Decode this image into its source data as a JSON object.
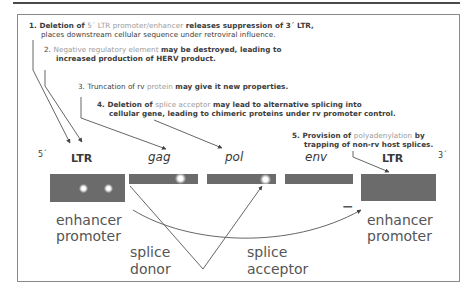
{
  "notes": [
    {
      "num": "1.",
      "parts": [
        {
          "t": "Deletion of ",
          "hl": false
        },
        {
          "t": "5´ LTR promoter/enhancer",
          "hl": true
        },
        {
          "t": " releases suppression of 3´ LTR,",
          "hl": false
        }
      ],
      "line2": "places downstream cellular sequence under retroviral influence."
    },
    {
      "num": "2.",
      "parts": [
        {
          "t": "Negative regulatory element",
          "hl": true
        },
        {
          "t": " may be destroyed, leading to",
          "hl": false
        }
      ],
      "line2": "increased production of HERV product."
    },
    {
      "num": "3.",
      "parts": [
        {
          "t": "Truncation of rv ",
          "hl": false
        },
        {
          "t": "protein",
          "hl": true
        },
        {
          "t": " may give it new properties.",
          "hl": false
        }
      ],
      "line2": ""
    },
    {
      "num": "4.",
      "parts": [
        {
          "t": "Deletion of ",
          "hl": false
        },
        {
          "t": "splice acceptor",
          "hl": true
        },
        {
          "t": " may lead to alternative splicing into",
          "hl": false
        }
      ],
      "line2": "cellular gene, leading to chimeric proteins under rv promoter control."
    },
    {
      "num": "5.",
      "parts": [
        {
          "t": "Provision of ",
          "hl": false
        },
        {
          "t": "polyadenylation",
          "hl": true
        },
        {
          "t": " by",
          "hl": false
        }
      ],
      "line2": "trapping of non-rv host splices."
    }
  ],
  "genome": {
    "end5": "5´",
    "end3": "3´",
    "segments": [
      {
        "label": "LTR",
        "italic": false
      },
      {
        "label": "gag",
        "italic": true
      },
      {
        "label": "pol",
        "italic": true
      },
      {
        "label": "env",
        "italic": true
      },
      {
        "label": "LTR",
        "italic": false
      }
    ]
  },
  "annotations": {
    "left_enhancer": "enhancer",
    "left_promoter": "promoter",
    "right_enhancer": "enhancer",
    "right_promoter": "promoter",
    "splice_donor_1": "splice",
    "splice_donor_2": "donor",
    "splice_acceptor_1": "splice",
    "splice_acceptor_2": "acceptor",
    "minus_sign": "−"
  },
  "colors": {
    "box": "#6b6b6b",
    "text": "#3a3a3a",
    "highlight": "#9a9a9a",
    "frame": "#8a8a8a"
  }
}
